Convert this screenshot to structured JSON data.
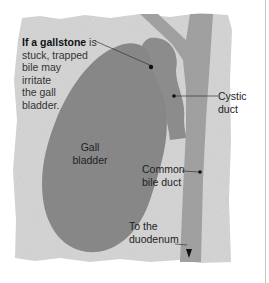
{
  "diagram": {
    "intro": {
      "bold": "If a gallstone",
      "rest_first": " is",
      "lines": [
        "stuck, trapped",
        "bile may",
        "irritate",
        "the gall",
        "bladder."
      ]
    },
    "labels": {
      "gall_bladder": [
        "Gall",
        "bladder"
      ],
      "cystic_duct": [
        "Cystic",
        "duct"
      ],
      "common_bile_duct": [
        "Common",
        "bile duct"
      ],
      "to_duodenum": [
        "To the",
        "duodenum"
      ]
    },
    "colors": {
      "paper": "#d9d9d9",
      "organ": "#8f8f8f",
      "duct": "#9a9a9a",
      "gallstone": "#111111",
      "rule": "#c8c8c8"
    }
  }
}
